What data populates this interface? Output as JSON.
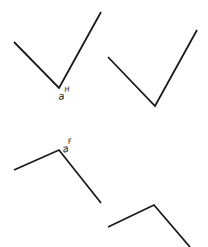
{
  "diagram": {
    "stroke_color": "#1a1a1a",
    "background": "#ffffff",
    "figures": [
      {
        "id": "figure-top-left",
        "points": "14,42 59,88 101,12",
        "label": {
          "base": "a",
          "superscript": "H"
        }
      },
      {
        "id": "figure-top-right",
        "points": "108,57 155,106 197,30"
      },
      {
        "id": "figure-bottom-left",
        "points": "14,170 59,150 101,203",
        "label": {
          "base": "a",
          "superscript": "F"
        }
      },
      {
        "id": "figure-bottom-right",
        "points": "108,227 154,205 190,247"
      }
    ]
  }
}
